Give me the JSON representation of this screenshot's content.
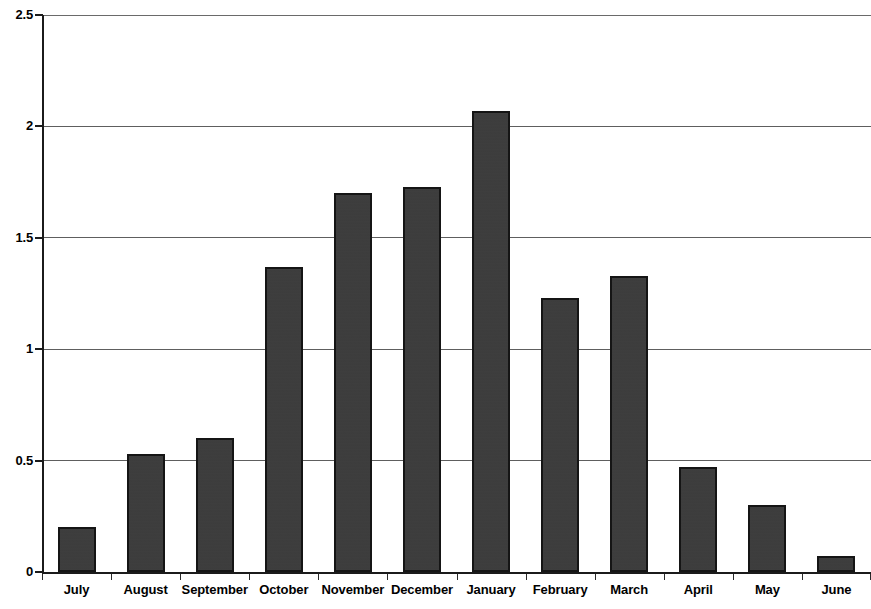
{
  "chart_data": {
    "type": "bar",
    "title": "",
    "subtitle": "",
    "xlabel": "",
    "ylabel": "",
    "categories": [
      "July",
      "August",
      "September",
      "October",
      "November",
      "December",
      "January",
      "February",
      "March",
      "April",
      "May",
      "June"
    ],
    "values": [
      0.2,
      0.53,
      0.6,
      1.37,
      1.7,
      1.73,
      2.07,
      1.23,
      1.33,
      0.47,
      0.3,
      0.07
    ],
    "series": [
      {
        "name": "",
        "values": [
          0.2,
          0.53,
          0.6,
          1.37,
          1.7,
          1.73,
          2.07,
          1.23,
          1.33,
          0.47,
          0.3,
          0.07
        ]
      }
    ],
    "ylim": [
      0,
      2.5
    ],
    "y_ticks": [
      0,
      0.5,
      1,
      1.5,
      2,
      2.5
    ],
    "y_tick_labels": [
      "0",
      "0.5",
      "1",
      "1.5",
      "2",
      "2.5"
    ],
    "grid": true,
    "grid_axis": "y",
    "legend": "none",
    "bar_color": "#3b3b3b",
    "bar_edge_color": "#151515",
    "gridline_color": "#5e5e5e",
    "axis_color": "#1b1b1b",
    "background_color": "#ffffff",
    "annotations": []
  }
}
